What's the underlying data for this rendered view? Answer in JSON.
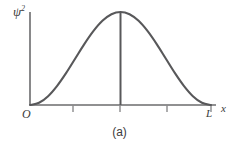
{
  "figure": {
    "caption": "(a)",
    "background_color": "#ffffff",
    "curve_color": "#58585a",
    "axis_color": "#6b6b6d",
    "text_color": "#3a3a3a"
  },
  "labels": {
    "y_axis_symbol": "ψ",
    "y_axis_exponent": "2",
    "origin": "O",
    "x_end": "L",
    "x_axis": "x"
  },
  "chart_data": {
    "type": "line",
    "title": "",
    "subtitle": "",
    "xlabel": "x",
    "ylabel": "ψ²",
    "grid": false,
    "legend": null,
    "xlim": [
      0,
      1
    ],
    "ylim": [
      0,
      1
    ],
    "x_tick_labels": [
      "O",
      "",
      "",
      "",
      "L"
    ],
    "x_ticks": [
      0,
      0.25,
      0.5,
      0.75,
      1
    ],
    "y_ticks": [],
    "y_tick_labels": [],
    "annotations": [
      {
        "name": "peak-vertical-line",
        "type": "vline",
        "x": 0.5,
        "y_from": 0,
        "y_to": 1.0
      }
    ],
    "series": [
      {
        "name": "psi-squared-n1",
        "x": [
          0.0,
          0.05,
          0.1,
          0.15,
          0.2,
          0.25,
          0.3,
          0.35,
          0.4,
          0.45,
          0.5,
          0.55,
          0.6,
          0.65,
          0.7,
          0.75,
          0.8,
          0.85,
          0.9,
          0.95,
          1.0
        ],
        "values": [
          0.0,
          0.024,
          0.095,
          0.206,
          0.345,
          0.5,
          0.655,
          0.794,
          0.905,
          0.976,
          1.0,
          0.976,
          0.905,
          0.794,
          0.655,
          0.5,
          0.345,
          0.206,
          0.095,
          0.024,
          0.0
        ]
      }
    ]
  },
  "geometry": {
    "y_axis_x": 30,
    "x_axis_y": 105,
    "axis_top_y": 12,
    "axis_right_x": 216,
    "plot_left_x": 30,
    "plot_right_x": 211,
    "peak_x": 120,
    "peak_y": 12,
    "tick_length": 6,
    "tick_positions_x": [
      73,
      120,
      167
    ]
  }
}
